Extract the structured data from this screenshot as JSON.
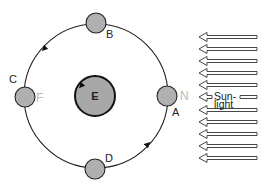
{
  "diagram": {
    "earth": {
      "label": "E",
      "cx": 95,
      "cy": 96,
      "r": 20,
      "fill": "#a8a8a8"
    },
    "orbit": {
      "cx": 96,
      "cy": 96,
      "r": 72,
      "direction": "counterclockwise"
    },
    "moons": [
      {
        "label": "A",
        "cx": 167,
        "cy": 96,
        "label_x": 172,
        "label_y": 116,
        "annotation": "N",
        "ann_x": 180,
        "ann_y": 100
      },
      {
        "label": "B",
        "cx": 96,
        "cy": 23,
        "label_x": 106,
        "label_y": 38,
        "annotation": "",
        "ann_x": 0,
        "ann_y": 0
      },
      {
        "label": "C",
        "cx": 25,
        "cy": 97,
        "label_x": 9,
        "label_y": 83,
        "annotation": "F",
        "ann_x": 36,
        "ann_y": 102
      },
      {
        "label": "D",
        "cx": 95,
        "cy": 169,
        "label_x": 105,
        "label_y": 162,
        "annotation": "",
        "ann_x": 0,
        "ann_y": 0
      }
    ],
    "moon_radius": 10,
    "moon_fill": "#b0b0b0",
    "sunlight": {
      "label_line1": "Sun-",
      "label_line2": "light",
      "arrow_rows_y": [
        37,
        49,
        61,
        73,
        85,
        110,
        122,
        134,
        146,
        158
      ],
      "label_row_y": 97,
      "tip_x": 199,
      "end_x": 257
    }
  }
}
